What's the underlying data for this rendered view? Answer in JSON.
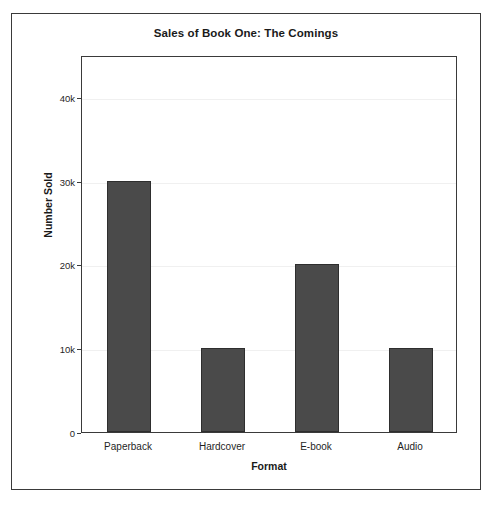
{
  "chart_data": {
    "type": "bar",
    "title": "Sales of Book One: The Comings",
    "xlabel": "Format",
    "ylabel": "Number Sold",
    "categories": [
      "Paperback",
      "Hardcover",
      "E-book",
      "Audio"
    ],
    "values": [
      30000,
      10000,
      20000,
      10000
    ],
    "ylim": [
      0,
      45000
    ],
    "yticks": [
      0,
      10000,
      20000,
      30000,
      40000
    ],
    "ytick_labels": [
      "0",
      "10k",
      "20k",
      "30k",
      "40k"
    ],
    "grid": true,
    "legend": null,
    "bar_color": "#4a4a4a",
    "bar_edge_color": "#2e2e2e",
    "background_color": "#ffffff",
    "frame_color": "#3a3a3a",
    "gridline_color": "#f0f0f0"
  }
}
